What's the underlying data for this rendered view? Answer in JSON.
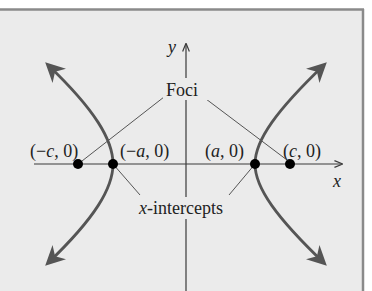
{
  "figure": {
    "background": "#ebebeb",
    "frame_color": "#8a8a8a",
    "axis_color": "#3a3a3a",
    "curve_color": "#555555",
    "leader_color": "#555555",
    "point_color": "#000000"
  },
  "axes": {
    "x_label": "x",
    "y_label": "y"
  },
  "labels": {
    "foci": "Foci",
    "x_intercepts": "x-intercepts",
    "neg_c": "(−c, 0)",
    "neg_a": "(−a, 0)",
    "pos_a": "(a, 0)",
    "pos_c": "(c, 0)"
  },
  "points": [
    {
      "name": "left-focus",
      "label": "(−c, 0)"
    },
    {
      "name": "left-vertex",
      "label": "(−a, 0)"
    },
    {
      "name": "right-vertex",
      "label": "(a, 0)"
    },
    {
      "name": "right-focus",
      "label": "(c, 0)"
    }
  ]
}
